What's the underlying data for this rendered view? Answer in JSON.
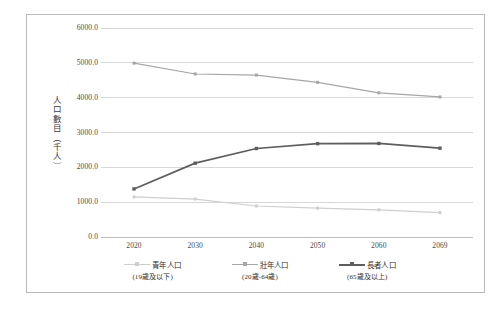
{
  "chart_data": {
    "type": "line",
    "title": "",
    "xlabel": "",
    "ylabel": "人口數目（千人）",
    "categories": [
      "2020",
      "2030",
      "2040",
      "2050",
      "2060",
      "2069"
    ],
    "ylim": [
      0,
      6000
    ],
    "ytick_labels": [
      "6000.0",
      "5000.0",
      "4000.0",
      "3000.0",
      "2000.0",
      "1000.0",
      "0.0"
    ],
    "ytick_values": [
      6000,
      5000,
      4000,
      3000,
      2000,
      1000,
      0
    ],
    "grid": true,
    "legend_position": "bottom",
    "series": [
      {
        "name": "青年人口",
        "sublabel": "(19歲及以下)",
        "color": "#cfcfcf",
        "values": [
          1150,
          1090,
          890,
          830,
          780,
          700
        ]
      },
      {
        "name": "壯年人口",
        "sublabel": "(20歲-64歲)",
        "color": "#a6a6a6",
        "values": [
          4990,
          4680,
          4650,
          4440,
          4140,
          4020
        ]
      },
      {
        "name": "長者人口",
        "sublabel": "(65歲及以上)",
        "color": "#5e5e5e",
        "values": [
          1380,
          2120,
          2540,
          2680,
          2685,
          2550
        ]
      }
    ]
  }
}
